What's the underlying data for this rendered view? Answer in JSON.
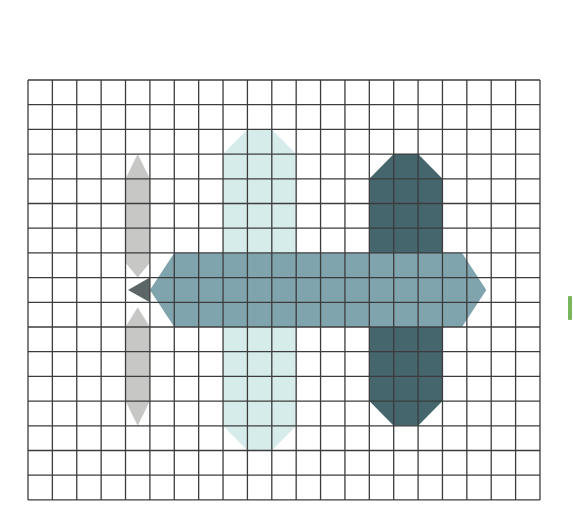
{
  "figure": {
    "grid": {
      "columns": 21,
      "rows": 17,
      "origin_x": 28,
      "origin_y": 80,
      "cell_width": 24.38,
      "cell_height": 24.7,
      "line_color": "#3c3c3c",
      "background": "#ffffff"
    },
    "shapes": [
      {
        "name": "propeller-top-blade",
        "color": "#c7c7c5",
        "points_grid": [
          [
            4.5,
            3
          ],
          [
            5,
            4
          ],
          [
            5,
            7.4
          ],
          [
            4.5,
            8
          ],
          [
            4,
            7.4
          ],
          [
            4,
            4
          ]
        ]
      },
      {
        "name": "propeller-bottom-blade",
        "color": "#c7c7c5",
        "points_grid": [
          [
            4.5,
            9.2
          ],
          [
            5,
            10
          ],
          [
            5,
            13
          ],
          [
            4.5,
            14
          ],
          [
            4,
            13
          ],
          [
            4,
            10
          ]
        ]
      },
      {
        "name": "light-wing",
        "color": "#d6ecea",
        "points_grid": [
          [
            8,
            3
          ],
          [
            9,
            2
          ],
          [
            10,
            2
          ],
          [
            11,
            3
          ],
          [
            11,
            14
          ],
          [
            10,
            15
          ],
          [
            9,
            15
          ],
          [
            8,
            14
          ]
        ]
      },
      {
        "name": "dark-tail",
        "color": "#44666c",
        "points_grid": [
          [
            14,
            4
          ],
          [
            15,
            3
          ],
          [
            16,
            3
          ],
          [
            17,
            4
          ],
          [
            17,
            13
          ],
          [
            16,
            14
          ],
          [
            15,
            14
          ],
          [
            14,
            13
          ]
        ]
      },
      {
        "name": "fuselage",
        "color": "#80a4ad",
        "points_grid": [
          [
            5,
            8.5
          ],
          [
            6,
            7
          ],
          [
            17.8,
            7
          ],
          [
            18.8,
            8.5
          ],
          [
            17.8,
            10
          ],
          [
            6,
            10
          ]
        ]
      },
      {
        "name": "nose-cone",
        "color": "#5d6667",
        "points_grid": [
          [
            4.1,
            8.5
          ],
          [
            5,
            8
          ],
          [
            5,
            9
          ]
        ]
      }
    ],
    "edge_marker_color": "#7cb65c"
  }
}
